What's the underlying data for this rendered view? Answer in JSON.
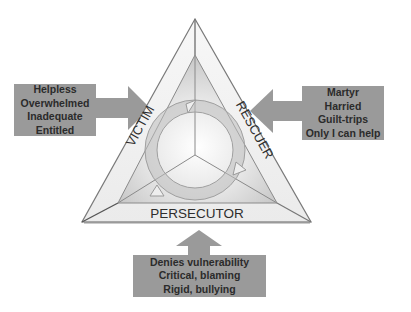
{
  "diagram": {
    "roles": {
      "victim": {
        "label": "VICTIM",
        "traits": [
          "Helpless",
          "Overwhelmed",
          "Inadequate",
          "Entitled"
        ]
      },
      "rescuer": {
        "label": "RESCUER",
        "traits": [
          "Martyr",
          "Harried",
          "Guilt-trips",
          "Only I can help"
        ]
      },
      "persecutor": {
        "label": "PERSECUTOR",
        "traits": [
          "Denies vulnerability",
          "Critical, blaming",
          "Rigid, bullying"
        ]
      }
    },
    "colors": {
      "box_fill": "#9a9a9a",
      "arrow_fill": "#9a9a9a",
      "triangle_stroke": "#6e6e6e",
      "inner_fill": "#dcdcdc",
      "text": "#2b2b2b"
    }
  }
}
